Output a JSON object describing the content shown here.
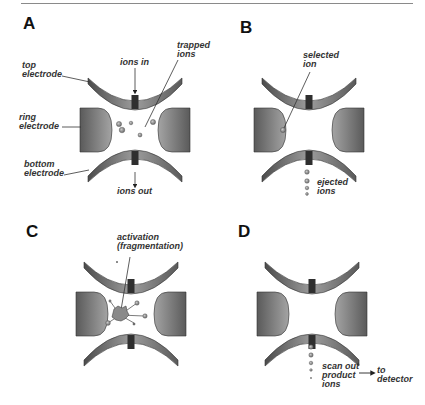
{
  "figure": {
    "panels": [
      {
        "id": "A",
        "label": "A",
        "annotations": {
          "top_electrode": [
            "top",
            "electrode"
          ],
          "ring_electrode": [
            "ring",
            "electrode"
          ],
          "bottom_electrode": [
            "bottom",
            "electrode"
          ],
          "ions_in": "ions in",
          "ions_out": "ions out",
          "trapped_ions": [
            "trapped",
            "ions"
          ]
        }
      },
      {
        "id": "B",
        "label": "B",
        "annotations": {
          "selected_ion": [
            "selected",
            "ion"
          ],
          "ejected_ions": [
            "ejected",
            "ions"
          ]
        }
      },
      {
        "id": "C",
        "label": "C",
        "annotations": {
          "activation": [
            "activation",
            "(fragmentation)"
          ]
        }
      },
      {
        "id": "D",
        "label": "D",
        "annotations": {
          "scan_out": [
            "scan out",
            "product",
            "ions"
          ],
          "to_detector": [
            "to",
            "detector"
          ]
        }
      }
    ],
    "colors": {
      "electrode_dark": "#4a4a4a",
      "electrode_light": "#a8a8a8",
      "electrode_slot": "#2e2e2e",
      "ion_fill": "#9a9a9a",
      "text": "#333333"
    }
  }
}
